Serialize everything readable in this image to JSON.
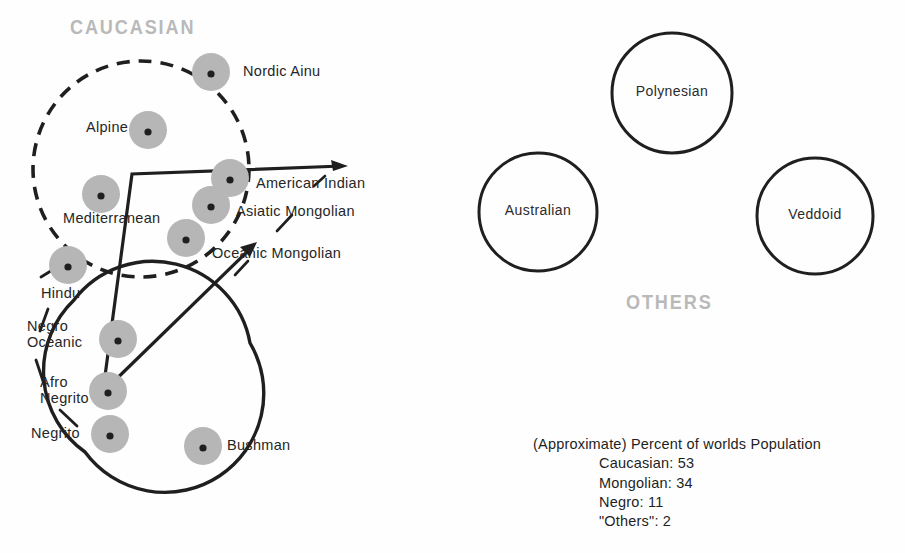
{
  "diagram": {
    "caption_groups": {
      "caucasian": "CAUCASIAN",
      "others": "OTHERS"
    },
    "blobs": [
      {
        "key": "nordic_ainu",
        "label": "Nordic Ainu",
        "cx": 211,
        "cy": 72,
        "r": 19,
        "label_x": 243,
        "label_y": 64
      },
      {
        "key": "alpine",
        "label": "Alpine",
        "cx": 148,
        "cy": 130,
        "r": 19,
        "label_x": 86,
        "label_y": 120
      },
      {
        "key": "mediterranean",
        "label": "Mediterranean",
        "cx": 101,
        "cy": 194,
        "r": 19,
        "label_x": 63,
        "label_y": 211
      },
      {
        "key": "american_indian",
        "label": "American Indian",
        "cx": 230,
        "cy": 178,
        "r": 19,
        "label_x": 256,
        "label_y": 176
      },
      {
        "key": "asiatic_mongolian",
        "label": "Asiatic Mongolian",
        "cx": 211,
        "cy": 205,
        "r": 19,
        "label_x": 236,
        "label_y": 204
      },
      {
        "key": "oceanic_mongolian",
        "label": "Oceanic Mongolian",
        "cx": 186,
        "cy": 238,
        "r": 19,
        "label_x": 212,
        "label_y": 246
      },
      {
        "key": "hindu",
        "label": "Hindu",
        "cx": 68,
        "cy": 265,
        "r": 19,
        "label_x": 41,
        "label_y": 286
      },
      {
        "key": "negro_oceanic",
        "label": "Negro Oceanic",
        "cx": 118,
        "cy": 339,
        "r": 19,
        "label_x": 27,
        "label_y": 318
      },
      {
        "key": "afro_negrito",
        "label": "Afro Negrito",
        "cx": 108,
        "cy": 391,
        "r": 19,
        "label_x": 40,
        "label_y": 374
      },
      {
        "key": "negrito",
        "label": "Negrito",
        "cx": 110,
        "cy": 434,
        "r": 19,
        "label_x": 31,
        "label_y": 426
      },
      {
        "key": "bushman",
        "label": "Bushman",
        "cx": 203,
        "cy": 446,
        "r": 19,
        "label_x": 227,
        "label_y": 438
      }
    ],
    "other_circles": [
      {
        "key": "polynesian",
        "label": "Polynesian",
        "cx": 672,
        "cy": 93,
        "r": 60
      },
      {
        "key": "australian",
        "label": "Australian",
        "cx": 538,
        "cy": 212,
        "r": 59
      },
      {
        "key": "veddoid",
        "label": "Veddoid",
        "cx": 815,
        "cy": 216,
        "r": 58
      }
    ],
    "enclosures": {
      "caucasian_circle": {
        "cx": 141,
        "cy": 169,
        "r": 108,
        "style": "dashed"
      },
      "negro_circle": {
        "cx": 165,
        "cy": 360,
        "r": 99,
        "style": "solid-open"
      }
    },
    "colors": {
      "blob_fill": "#b6b6b6",
      "blob_dot": "#1f1f1f",
      "stroke": "#1f1f1f",
      "group_title": "#b9b9b9",
      "text": "#262626",
      "background": "#fefefe"
    }
  },
  "stats": {
    "heading": "(Approximate) Percent of worlds Population",
    "rows": [
      {
        "label": "Caucasian:",
        "value": "53"
      },
      {
        "label": "Mongolian:",
        "value": "34"
      },
      {
        "label": "Negro:",
        "value": "11"
      },
      {
        "label": "\"Others\":",
        "value": "2"
      }
    ],
    "lines": [
      "Caucasian: 53",
      "Mongolian:  34",
      "Negro:  11",
      "\"Others\":  2"
    ]
  },
  "chart_data": {
    "type": "pie",
    "title": "(Approximate) Percent of worlds Population",
    "categories": [
      "Caucasian",
      "Mongolian",
      "Negro",
      "\"Others\""
    ],
    "values": [
      53,
      34,
      11,
      2
    ],
    "unit": "percent",
    "legend": "inline-text-list"
  }
}
